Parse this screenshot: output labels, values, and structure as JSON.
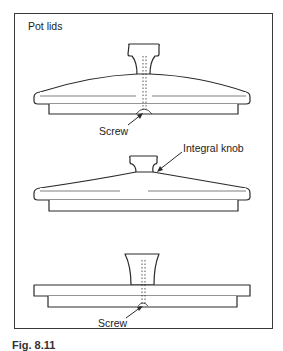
{
  "figure": {
    "title": "Pot lids",
    "caption": "Fig. 8.11",
    "labels": {
      "screw_top": "Screw",
      "integral_knob": "Integral knob",
      "screw_bottom": "Screw"
    },
    "lids": [
      {
        "id": "domed-lid-screwed-knob",
        "annotation": "Screw"
      },
      {
        "id": "domed-lid-integral-knob",
        "annotation": "Integral knob"
      },
      {
        "id": "flat-lid-screwed-knob",
        "annotation": "Screw"
      }
    ],
    "colors": {
      "line": "#2a2a2a",
      "background": "#ffffff"
    }
  }
}
